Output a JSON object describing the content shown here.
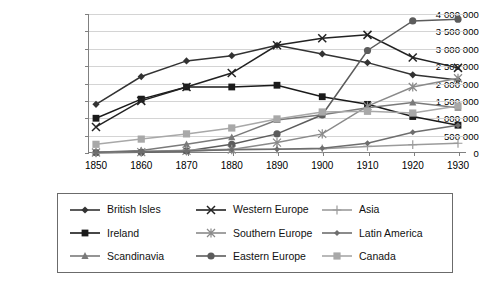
{
  "chart_data": {
    "type": "line",
    "title": "",
    "xlabel": "",
    "ylabel": "",
    "x": [
      1850,
      1860,
      1870,
      1880,
      1890,
      1900,
      1910,
      1920,
      1930
    ],
    "xtick_labels": [
      "1850",
      "1860",
      "1870",
      "1880",
      "1890",
      "1900",
      "1910",
      "1920",
      "1930"
    ],
    "ylim": [
      0,
      4000000
    ],
    "ytick_values": [
      0,
      500000,
      1000000,
      1500000,
      2000000,
      2500000,
      3000000,
      3500000,
      4000000
    ],
    "ytick_labels": [
      "0",
      "500 000",
      "1 000 000",
      "1 500 000",
      "2 000 000",
      "2 500 000",
      "3 000 000",
      "3 500 000",
      "4 000 000"
    ],
    "grid": true,
    "legend_position": "bottom",
    "series": [
      {
        "name": "British Isles",
        "marker": "diamond",
        "color": "#333333",
        "values": [
          1400000,
          2200000,
          2650000,
          2800000,
          3100000,
          2850000,
          2600000,
          2250000,
          2100000
        ]
      },
      {
        "name": "Ireland",
        "marker": "square",
        "color": "#1a1a1a",
        "values": [
          1000000,
          1550000,
          1900000,
          1900000,
          1950000,
          1620000,
          1400000,
          1050000,
          800000
        ]
      },
      {
        "name": "Scandinavia",
        "marker": "triangle",
        "color": "#7a7a7a",
        "values": [
          25000,
          75000,
          250000,
          450000,
          950000,
          1100000,
          1300000,
          1450000,
          1300000
        ]
      },
      {
        "name": "Western Europe",
        "marker": "x",
        "color": "#222222",
        "values": [
          750000,
          1500000,
          1900000,
          2300000,
          3100000,
          3300000,
          3400000,
          2750000,
          2450000
        ]
      },
      {
        "name": "Southern Europe",
        "marker": "asterisk",
        "color": "#8a8a8a",
        "values": [
          15000,
          25000,
          60000,
          100000,
          300000,
          550000,
          1350000,
          1900000,
          2150000
        ]
      },
      {
        "name": "Eastern Europe",
        "marker": "circle",
        "color": "#5c5c5c",
        "values": [
          10000,
          20000,
          60000,
          250000,
          550000,
          1100000,
          2950000,
          3800000,
          3850000
        ]
      },
      {
        "name": "Asia",
        "marker": "plus",
        "color": "#9b9b9b",
        "values": [
          5000,
          40000,
          80000,
          110000,
          110000,
          120000,
          190000,
          240000,
          280000
        ]
      },
      {
        "name": "Latin America",
        "marker": "small-diamond",
        "color": "#6e6e6e",
        "values": [
          20000,
          40000,
          60000,
          90000,
          110000,
          140000,
          280000,
          600000,
          800000
        ]
      },
      {
        "name": "Canada",
        "marker": "light-square",
        "color": "#a8a8a8",
        "values": [
          250000,
          400000,
          550000,
          720000,
          980000,
          1180000,
          1200000,
          1150000,
          1350000
        ]
      }
    ]
  },
  "legend": {
    "items": [
      {
        "label": "British Isles"
      },
      {
        "label": "Ireland"
      },
      {
        "label": "Scandinavia"
      },
      {
        "label": "Western Europe"
      },
      {
        "label": "Southern Europe"
      },
      {
        "label": "Eastern Europe"
      },
      {
        "label": "Asia"
      },
      {
        "label": "Latin America"
      },
      {
        "label": "Canada"
      }
    ]
  }
}
